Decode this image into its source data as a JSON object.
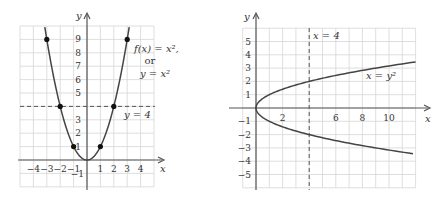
{
  "left_graph": {
    "axis_x_label": "x",
    "axis_y_label": "y",
    "x_ticks": [
      "-4",
      "-3",
      "-2",
      "-1",
      "1",
      "2",
      "3",
      "4"
    ],
    "y_ticks": [
      "1",
      "2",
      "3",
      "5",
      "6",
      "7",
      "8",
      "9"
    ],
    "y_neg_tick": "-1",
    "curve_label_line1": "f(x) = x²,",
    "curve_label_line2": "or",
    "curve_label_line3": "y = x²",
    "dashed_label": "y = 4",
    "points": [
      [
        -3,
        9
      ],
      [
        -2,
        4
      ],
      [
        -1,
        1
      ],
      [
        1,
        1
      ],
      [
        2,
        4
      ],
      [
        3,
        9
      ]
    ]
  },
  "right_graph": {
    "axis_x_label": "x",
    "axis_y_label": "y",
    "x_ticks": [
      "2",
      "6",
      "8",
      "10"
    ],
    "y_ticks_pos": [
      "1",
      "2",
      "3",
      "4",
      "5"
    ],
    "y_ticks_neg": [
      "-1",
      "-2",
      "-3",
      "-4",
      "-5"
    ],
    "curve_label": "x = y²",
    "dashed_label": "x = 4"
  },
  "chart_data": [
    {
      "type": "line",
      "title": "f(x) = x², or y = x²",
      "xlabel": "x",
      "ylabel": "y",
      "xlim": [
        -5,
        5
      ],
      "ylim": [
        -2,
        10
      ],
      "grid": true,
      "series": [
        {
          "name": "y = x^2",
          "x": [
            -3.2,
            -3,
            -2,
            -1,
            0,
            1,
            2,
            3,
            3.2
          ],
          "y": [
            10.24,
            9,
            4,
            1,
            0,
            1,
            4,
            9,
            10.24
          ]
        },
        {
          "name": "y = 4 (dashed)",
          "x": [
            -5,
            5
          ],
          "y": [
            4,
            4
          ]
        }
      ],
      "marked_points": [
        [
          -3,
          9
        ],
        [
          -2,
          4
        ],
        [
          -1,
          1
        ],
        [
          1,
          1
        ],
        [
          2,
          4
        ],
        [
          3,
          9
        ]
      ],
      "annotations": [
        "f(x) = x², or y = x²",
        "y = 4"
      ]
    },
    {
      "type": "line",
      "title": "x = y²",
      "xlabel": "x",
      "ylabel": "y",
      "xlim": [
        -1,
        12
      ],
      "ylim": [
        -6,
        6
      ],
      "grid": true,
      "series": [
        {
          "name": "x = y^2",
          "x": [
            12,
            9,
            4,
            1,
            0,
            1,
            4,
            9,
            12
          ],
          "y": [
            3.46,
            3,
            2,
            1,
            0,
            -1,
            -2,
            -3,
            -3.46
          ]
        },
        {
          "name": "x = 4 (dashed)",
          "x": [
            4,
            4
          ],
          "y": [
            -6,
            6
          ]
        }
      ],
      "annotations": [
        "x = y²",
        "x = 4"
      ]
    }
  ]
}
